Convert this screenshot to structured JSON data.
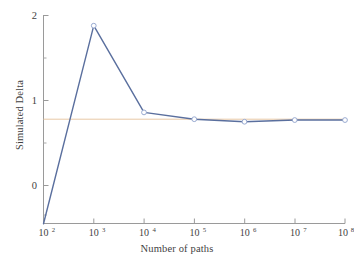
{
  "figure": {
    "background_color": "#ffffff",
    "caption_fragment": ""
  },
  "chart_data": {
    "type": "line",
    "title": "",
    "subtitle": "",
    "xlabel": "Number of paths",
    "ylabel": "Simulated Delta",
    "xscale": "log",
    "yscale": "linear",
    "grid": false,
    "legend": null,
    "legend_position": "none",
    "xlim": [
      100,
      100000000
    ],
    "ylim": [
      -0.47,
      2.05
    ],
    "x_tick_labels": [
      "10²",
      "10³",
      "10⁴",
      "10⁵",
      "10⁶",
      "10⁷",
      "10⁸"
    ],
    "x_tick_values": [
      100,
      1000,
      10000,
      100000,
      1000000,
      10000000,
      100000000
    ],
    "y_tick_labels": [
      "0",
      "1",
      "2"
    ],
    "y_tick_values": [
      0,
      1,
      2
    ],
    "y_minor_tick_values": [
      -0.5,
      0.5,
      1.5
    ],
    "series": [
      {
        "name": "Simulated Delta",
        "color": "#5a6f9e",
        "marker": "circle-open",
        "marker_color": "#8fa2cc",
        "line_width": 1.4,
        "x": [
          100,
          1000,
          10000,
          100000,
          1000000,
          10000000,
          100000000
        ],
        "values": [
          -0.45,
          1.88,
          0.86,
          0.78,
          0.75,
          0.77,
          0.77
        ]
      }
    ],
    "reference_lines": [
      {
        "name": "analytic-delta",
        "orientation": "horizontal",
        "value": 0.78,
        "color": "#e8c9a6",
        "line_width": 1
      }
    ]
  }
}
